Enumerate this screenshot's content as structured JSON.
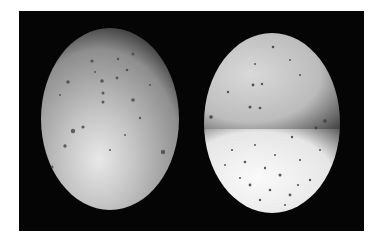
{
  "image": {
    "description": "Photograph of two speckled eggs on a black background",
    "background_color": "#050505",
    "eggs": [
      {
        "name": "left-egg",
        "cx": 110,
        "cy": 119,
        "rx": 69,
        "ry": 91,
        "base_color": "#b8b8b8",
        "highlight_color": "#e6e6e6"
      },
      {
        "name": "right-egg",
        "cx": 272,
        "cy": 123,
        "rx": 68,
        "ry": 90,
        "top_color": "#cfcfcf",
        "bottom_color": "#f4f4f4",
        "split_y": 129
      }
    ]
  }
}
